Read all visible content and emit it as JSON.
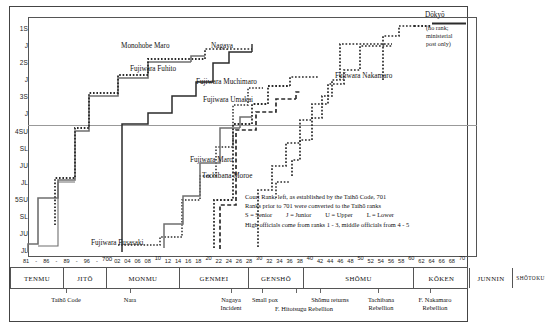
{
  "chart_data": {
    "type": "line",
    "xlabel": "Year (7th-8th century CE)",
    "ylabel": "Court Rank",
    "grid": false,
    "legend_position": "inside-lower-right",
    "x": [
      681,
      686,
      689,
      696,
      700,
      702,
      704,
      706,
      708,
      710,
      712,
      714,
      716,
      718,
      720,
      722,
      724,
      726,
      728,
      730,
      732,
      734,
      736,
      738,
      740,
      742,
      744,
      746,
      748,
      750,
      752,
      754,
      756,
      758,
      760,
      762,
      764,
      766,
      768,
      770
    ],
    "xlim": [
      680,
      771
    ],
    "y_categories": [
      "1S",
      "J",
      "2S",
      "J",
      "3S",
      "J",
      "4SU",
      "SL",
      "JU",
      "JL",
      "5SU",
      "SL",
      "JU",
      "JL"
    ],
    "ylim_note": "Court rank descending: 1 Senior (highest) at top to 5 Junior Lower (lowest) at bottom",
    "series": [
      {
        "name": "Mononobe Maro",
        "style": "dotted",
        "rank_at_end": "2S"
      },
      {
        "name": "Fujiwara Fuhito",
        "style": "solid",
        "rank_at_end": "2S"
      },
      {
        "name": "Nagaya",
        "style": "solid",
        "rank_at_end": "2S"
      },
      {
        "name": "Fujiwara Muchimaro",
        "style": "dotted",
        "rank_at_end": "3S"
      },
      {
        "name": "Fujiwara Umakai",
        "style": "dashed",
        "rank_at_end": "3J"
      },
      {
        "name": "Fujiwara Maro",
        "style": "solid",
        "rank_at_end": "4SU"
      },
      {
        "name": "Tachibana Moroe",
        "style": "dotted",
        "rank_at_end": "1J"
      },
      {
        "name": "Fujiwara Fusasaki",
        "style": "dotted",
        "rank_at_end": "3S"
      },
      {
        "name": "Fujiwara Nakamaro",
        "style": "dotted",
        "rank_at_end": "1S"
      },
      {
        "name": "Dōkyō",
        "style": "dotted",
        "rank_at_end": "none"
      }
    ],
    "annotations": [
      "Dōkyō (no rank; ministerial post only)",
      "Court Rank, left, as established by the Taihō Code, 701"
    ]
  },
  "y_axis": {
    "labels": [
      "1S",
      "J",
      "2S",
      "J",
      "3S",
      "J",
      "4SU",
      "SL",
      "JU",
      "JL",
      "5SU",
      "SL",
      "JU",
      "JL"
    ]
  },
  "x_axis": {
    "ticks": [
      {
        "label": "81"
      },
      {
        "label": "-"
      },
      {
        "label": "86"
      },
      {
        "label": "-"
      },
      {
        "label": "89"
      },
      {
        "label": "-"
      },
      {
        "label": "96"
      },
      {
        "label": "-"
      },
      {
        "label": "700"
      },
      {
        "label": "02"
      },
      {
        "label": "04"
      },
      {
        "label": "06"
      },
      {
        "label": "08"
      },
      {
        "label": "10"
      },
      {
        "label": "12"
      },
      {
        "label": "14"
      },
      {
        "label": "16"
      },
      {
        "label": "18"
      },
      {
        "label": "20"
      },
      {
        "label": "22"
      },
      {
        "label": "24"
      },
      {
        "label": "26"
      },
      {
        "label": "28"
      },
      {
        "label": "30"
      },
      {
        "label": "32"
      },
      {
        "label": "34"
      },
      {
        "label": "36"
      },
      {
        "label": "38"
      },
      {
        "label": "40"
      },
      {
        "label": "42"
      },
      {
        "label": "44"
      },
      {
        "label": "46"
      },
      {
        "label": "48"
      },
      {
        "label": "50"
      },
      {
        "label": "52"
      },
      {
        "label": "54"
      },
      {
        "label": "56"
      },
      {
        "label": "58"
      },
      {
        "label": "60"
      },
      {
        "label": "62"
      },
      {
        "label": "64"
      },
      {
        "label": "66"
      },
      {
        "label": "68"
      },
      {
        "label": "70"
      }
    ]
  },
  "person_labels": {
    "mononobe_maro": "Monohobe Maro",
    "fujiwara_fuhito": "Fujiwara Fuhito",
    "nagaya": "Nagaya",
    "fujiwara_muchimaro": "Fujiwara Muchimaro",
    "fujiwara_umakai": "Fujiwara Umakai",
    "fujiwara_maro": "Fujiwara Maro",
    "tachibana_moroe": "Tachibana Moroe",
    "fujiwara_fusasaki": "Fujiwara Fusasaki",
    "fujiwara_nakamaro": "Fujiwara Nakamaro",
    "dokyo": "Dōkyō",
    "dokyo_note_l1": "(no rank;",
    "dokyo_note_l2": "ministerial",
    "dokyo_note_l3": "post only)"
  },
  "legend": {
    "line1": "Court Rank, left,  as established by the Taihō Code, 701",
    "line2": "Ranks prior to 701 were converted to the Taihō ranks",
    "line3_a": "S = Senior",
    "line3_b": "J = Junior",
    "line3_c": "U = Upper",
    "line3_d": "L = Lower",
    "line4": "High officials come from ranks 1 - 3,  middle officials from 4 - 5"
  },
  "eras": [
    {
      "name": "TENMU"
    },
    {
      "name": "JITŌ"
    },
    {
      "name": "MONMU"
    },
    {
      "name": "GENMEI"
    },
    {
      "name": "GENSHŌ"
    },
    {
      "name": "SHŌMU"
    },
    {
      "name": "KŌKEN"
    },
    {
      "name": "JUNNIN"
    },
    {
      "name": "SHŌTOKU"
    }
  ],
  "events": [
    {
      "line1": "Taihō Code",
      "line2": ""
    },
    {
      "line1": "Nara",
      "line2": ""
    },
    {
      "line1": "Nagaya",
      "line2": "Incident"
    },
    {
      "line1": "Small pox",
      "line2": ""
    },
    {
      "line1": "F. Hitotsugu Rebellion",
      "line2": ""
    },
    {
      "line1": "Shōmu returns",
      "line2": ""
    },
    {
      "line1": "Tachibana",
      "line2": "Rebellion"
    },
    {
      "line1": "F. Nakamaro",
      "line2": "Rebellion"
    }
  ],
  "colors": {
    "line_dark": "#2b2b2b",
    "line_grey": "#6f6f6f",
    "frame": "#444444",
    "rule": "#999999"
  }
}
